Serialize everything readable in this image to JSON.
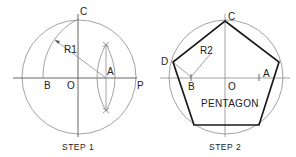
{
  "step1": {
    "caption": "STEP 1",
    "labels": {
      "C": "C",
      "R1": "R1",
      "A": "A",
      "B": "B",
      "O": "O",
      "P": "P"
    }
  },
  "step2": {
    "caption": "STEP 2",
    "labels": {
      "C": "C",
      "D": "D",
      "R2": "R2",
      "A": "A",
      "B": "B",
      "O": "O"
    },
    "shape_label": "PENTAGON"
  },
  "colors": {
    "construction": "#8a8a8a",
    "outline": "#1a1a1a",
    "text": "#222222"
  }
}
